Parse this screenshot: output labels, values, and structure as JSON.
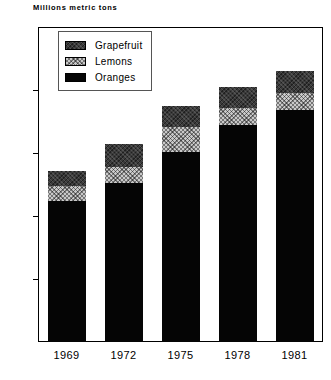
{
  "chart_data": {
    "type": "bar",
    "subtype": "stacked-bar",
    "title": "Millions metric tons",
    "xlabel": "",
    "ylabel": "",
    "ylim": [
      0,
      50
    ],
    "yticks": [
      0,
      10,
      20,
      30,
      40,
      50
    ],
    "grid": false,
    "legend_position": "top-left-inside",
    "categories": [
      "1969",
      "1972",
      "1975",
      "1978",
      "1981"
    ],
    "series": [
      {
        "name": "Oranges",
        "values": [
          22.4,
          25.2,
          30.1,
          34.4,
          36.8
        ]
      },
      {
        "name": "Lemons",
        "values": [
          2.4,
          2.6,
          4.1,
          2.7,
          2.7
        ]
      },
      {
        "name": "Grapefruit",
        "values": [
          2.4,
          3.6,
          3.2,
          3.4,
          3.6
        ]
      }
    ],
    "totals": [
      27.2,
      31.4,
      37.4,
      40.5,
      43.1
    ],
    "colors": {
      "Oranges": "#050505",
      "Lemons": "#c9c9c9",
      "Grapefruit": "#3a3a3a",
      "axis": "#000000",
      "background": "#ffffff"
    }
  },
  "legend": {
    "items": [
      {
        "label": "Grapefruit",
        "swatch": "grapefruit"
      },
      {
        "label": "Lemons",
        "swatch": "lemons"
      },
      {
        "label": "Oranges",
        "swatch": "oranges"
      }
    ]
  }
}
